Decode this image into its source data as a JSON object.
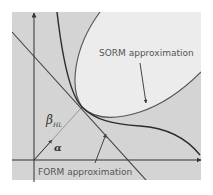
{
  "diagram": {
    "labels": {
      "sorm": "SORM approximation",
      "form": "FORM approximation",
      "beta": "β",
      "beta_sub": "HL",
      "alpha": "α"
    },
    "colors": {
      "background": "#ffffff",
      "failure_region": "#d4d4d4",
      "safe_region_inside_sorm": "#ececec",
      "axis": "#333333",
      "limit_state_curve": "#2b2b2b",
      "form_line": "#444444",
      "sorm_curve": "#555555",
      "beta_vector": "#888888",
      "text": "#555555"
    },
    "elements": [
      {
        "name": "x-axis",
        "type": "arrow"
      },
      {
        "name": "y-axis",
        "type": "arrow"
      },
      {
        "name": "limit-state-curve",
        "type": "curve"
      },
      {
        "name": "form-tangent-line",
        "type": "line"
      },
      {
        "name": "sorm-parabola",
        "type": "curve"
      },
      {
        "name": "beta-hl-vector",
        "type": "arrow"
      },
      {
        "name": "sorm-pointer-arrow",
        "type": "arrow"
      },
      {
        "name": "form-pointer-arrow",
        "type": "arrow"
      }
    ]
  }
}
